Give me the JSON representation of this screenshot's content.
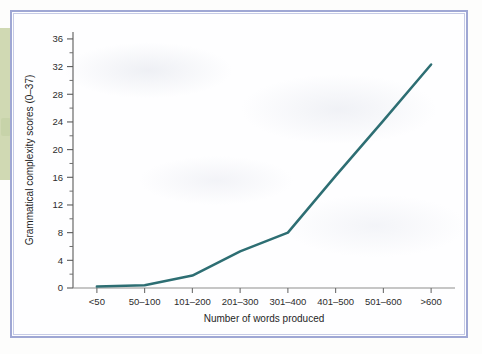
{
  "figure": {
    "frame_color": "#9fa7d4",
    "background_color": "#fefeff",
    "edge_artifact_color": "#ccd6ac"
  },
  "chart_data": {
    "type": "line",
    "title": "",
    "xlabel": "Number of words produced",
    "ylabel": "Grammatical complexity scores (0–37)",
    "categories": [
      "<50",
      "50–100",
      "101–200",
      "201–300",
      "301–400",
      "401–500",
      "501–600",
      ">600"
    ],
    "values": [
      0.2,
      0.4,
      1.8,
      5.3,
      8.0,
      16.2,
      24.2,
      32.3
    ],
    "series": [
      {
        "name": "Grammatical complexity",
        "color": "#2d6e73",
        "values": [
          0.2,
          0.4,
          1.8,
          5.3,
          8.0,
          16.2,
          24.2,
          32.3
        ]
      }
    ],
    "ylim": [
      0,
      37
    ],
    "ytick_labels": [
      "0",
      "4",
      "8",
      "12",
      "16",
      "20",
      "24",
      "28",
      "32",
      "36"
    ],
    "ytick_values": [
      0,
      4,
      8,
      12,
      16,
      20,
      24,
      28,
      32,
      36
    ],
    "minor_ytick_values": [
      2,
      6,
      10,
      14,
      18,
      22,
      26,
      30,
      34
    ],
    "grid": false,
    "legend": "none",
    "line_width": 2.5,
    "markers": false
  }
}
